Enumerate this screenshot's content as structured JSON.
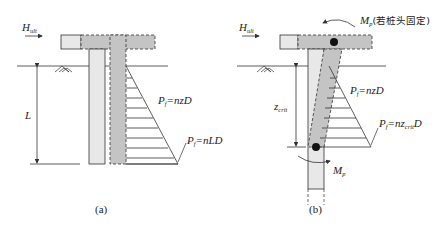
{
  "figure": {
    "colors": {
      "stroke": "#333333",
      "light_fill": "#e8e8e8",
      "dark_fill": "#c4c4c4",
      "background": "#ffffff"
    },
    "panel_a": {
      "caption": "(a)",
      "load_label": "H",
      "load_sub": "ult",
      "depth_label": "L",
      "pressure_mid_label": "P",
      "pressure_mid_sub": "f",
      "pressure_mid_rhs": "=nzD",
      "pressure_base_label": "P",
      "pressure_base_sub": "f",
      "pressure_base_rhs": "=nLD"
    },
    "panel_b": {
      "caption": "(b)",
      "load_label": "H",
      "load_sub": "ult",
      "top_moment_label": "M",
      "top_moment_sub": "p",
      "top_moment_note": "(若桩头固定)",
      "depth_label": "z",
      "depth_sub": "crit",
      "pressure_mid_label": "P",
      "pressure_mid_sub": "f",
      "pressure_mid_rhs": "=nzD",
      "pressure_base_label": "P",
      "pressure_base_sub": "f",
      "pressure_base_rhs_a": "=nz",
      "pressure_base_rhs_sub": "crit",
      "pressure_base_rhs_b": "D",
      "hinge_moment_label": "M",
      "hinge_moment_sub": "p"
    }
  }
}
